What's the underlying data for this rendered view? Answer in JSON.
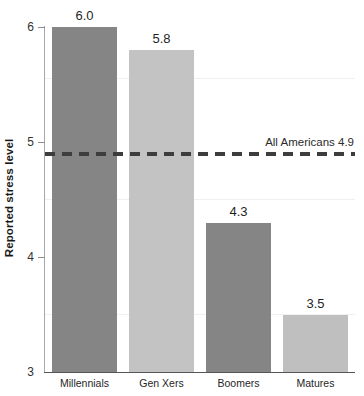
{
  "chart_data": {
    "type": "bar",
    "title": "",
    "xlabel": "",
    "ylabel": "Reported stress level",
    "categories": [
      "Millennials",
      "Gen Xers",
      "Boomers",
      "Matures"
    ],
    "values": [
      6.0,
      5.8,
      4.3,
      3.5
    ],
    "value_labels": [
      "6.0",
      "5.8",
      "4.3",
      "3.5"
    ],
    "bar_colors": [
      "#858585",
      "#c3c3c3",
      "#858585",
      "#bfbfbf"
    ],
    "ylim": [
      3,
      6
    ],
    "ytick_labels": [
      "6",
      "5",
      "4",
      "3"
    ],
    "ytick_values": [
      6,
      5,
      4,
      3
    ],
    "grid": "faint-horizontal",
    "legend": "none",
    "annotations": [
      {
        "name": "all-americans-reference",
        "label": "All Americans 4.9",
        "value": 4.9,
        "style": "dashed-horizontal-line",
        "color": "#3d3d3d"
      }
    ]
  },
  "axis": {
    "y_label": "Reported stress level",
    "ticks": [
      {
        "label": "6",
        "value": 6
      },
      {
        "label": "5",
        "value": 5
      },
      {
        "label": "4",
        "value": 4
      },
      {
        "label": "3",
        "value": 3
      }
    ]
  },
  "bars": [
    {
      "category": "Millennials",
      "value": 6.0,
      "value_label": "6.0",
      "color": "#858585"
    },
    {
      "category": "Gen Xers",
      "value": 5.8,
      "value_label": "5.8",
      "color": "#c3c3c3"
    },
    {
      "category": "Boomers",
      "value": 4.3,
      "value_label": "4.3",
      "color": "#858585"
    },
    {
      "category": "Matures",
      "value": 3.5,
      "value_label": "3.5",
      "color": "#bfbfbf"
    }
  ],
  "reference": {
    "label": "All Americans 4.9",
    "value": 4.9
  }
}
